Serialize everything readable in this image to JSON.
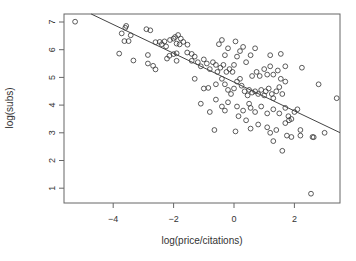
{
  "chart_data": {
    "type": "scatter",
    "title": "",
    "xlabel": "log(price/citations)",
    "ylabel": "log(subs)",
    "xlim": [
      -5.4,
      3.5
    ],
    "ylim": [
      0.5,
      7.3
    ],
    "xticks": [
      -4,
      -2,
      0,
      2
    ],
    "xtick_labels": [
      "-4",
      "-2",
      "0",
      "2"
    ],
    "yticks": [
      1,
      2,
      3,
      4,
      5,
      6,
      7
    ],
    "ytick_labels": [
      "1",
      "2",
      "3",
      "4",
      "5",
      "6",
      "7"
    ],
    "grid": false,
    "legend": null,
    "marker": "open-circle",
    "colors": {
      "points": "#333333",
      "line": "#444444",
      "axis": "#555555",
      "text": "#333333"
    },
    "fit_line": {
      "type": "linear",
      "intercept": 4.83,
      "slope": -0.52
    },
    "points": [
      [
        -5.26,
        7.01
      ],
      [
        -3.72,
        6.59
      ],
      [
        -3.6,
        6.79
      ],
      [
        -3.57,
        6.86
      ],
      [
        -3.63,
        6.31
      ],
      [
        -3.49,
        6.31
      ],
      [
        -3.42,
        6.52
      ],
      [
        -3.8,
        5.86
      ],
      [
        -2.9,
        6.74
      ],
      [
        -2.77,
        6.7
      ],
      [
        -2.6,
        6.27
      ],
      [
        -2.46,
        6.28
      ],
      [
        -2.39,
        6.2
      ],
      [
        -2.3,
        6.3
      ],
      [
        -2.25,
        6.12
      ],
      [
        -2.12,
        6.35
      ],
      [
        -2.0,
        6.4
      ],
      [
        -3.33,
        5.61
      ],
      [
        -2.85,
        5.5
      ],
      [
        -2.68,
        5.42
      ],
      [
        -2.6,
        5.29
      ],
      [
        -2.85,
        5.81
      ],
      [
        -2.22,
        5.68
      ],
      [
        -2.14,
        5.78
      ],
      [
        -2.0,
        5.84
      ],
      [
        -1.9,
        5.87
      ],
      [
        -1.95,
        6.46
      ],
      [
        -1.85,
        6.53
      ],
      [
        -1.76,
        6.4
      ],
      [
        -1.68,
        6.28
      ],
      [
        -1.9,
        6.22
      ],
      [
        -1.8,
        6.19
      ],
      [
        -1.54,
        6.18
      ],
      [
        -1.9,
        5.6
      ],
      [
        -1.55,
        5.9
      ],
      [
        -1.4,
        5.85
      ],
      [
        -1.3,
        5.75
      ],
      [
        -1.4,
        5.6
      ],
      [
        -1.2,
        5.55
      ],
      [
        -1.0,
        5.65
      ],
      [
        -0.9,
        5.5
      ],
      [
        -1.1,
        5.4
      ],
      [
        -0.8,
        5.3
      ],
      [
        -0.7,
        5.55
      ],
      [
        -0.6,
        5.45
      ],
      [
        -0.55,
        5.2
      ],
      [
        -0.45,
        5.35
      ],
      [
        -0.35,
        5.45
      ],
      [
        -0.25,
        5.2
      ],
      [
        -0.15,
        5.3
      ],
      [
        -0.05,
        5.2
      ],
      [
        0.0,
        5.45
      ],
      [
        -0.5,
        6.2
      ],
      [
        -0.4,
        6.35
      ],
      [
        -0.2,
        6.05
      ],
      [
        0.05,
        6.3
      ],
      [
        -0.3,
        5.8
      ],
      [
        0.1,
        5.75
      ],
      [
        0.3,
        6.1
      ],
      [
        0.55,
        5.8
      ],
      [
        0.4,
        5.55
      ],
      [
        -1.3,
        4.95
      ],
      [
        -1.0,
        4.6
      ],
      [
        -0.85,
        4.62
      ],
      [
        -0.6,
        4.75
      ],
      [
        -0.4,
        4.95
      ],
      [
        -0.3,
        4.75
      ],
      [
        -0.2,
        4.55
      ],
      [
        -0.1,
        4.4
      ],
      [
        0.0,
        4.6
      ],
      [
        0.1,
        4.85
      ],
      [
        0.2,
        4.95
      ],
      [
        0.25,
        4.7
      ],
      [
        0.35,
        4.5
      ],
      [
        0.45,
        4.35
      ],
      [
        0.5,
        4.55
      ],
      [
        0.6,
        4.45
      ],
      [
        0.7,
        4.5
      ],
      [
        0.8,
        4.4
      ],
      [
        0.9,
        4.55
      ],
      [
        1.0,
        4.35
      ],
      [
        1.05,
        4.5
      ],
      [
        1.15,
        4.6
      ],
      [
        1.25,
        4.4
      ],
      [
        1.3,
        4.25
      ],
      [
        1.4,
        4.5
      ],
      [
        1.5,
        4.65
      ],
      [
        1.6,
        4.4
      ],
      [
        0.6,
        5.05
      ],
      [
        0.75,
        5.2
      ],
      [
        0.85,
        5.05
      ],
      [
        1.0,
        5.3
      ],
      [
        1.1,
        5.1
      ],
      [
        1.2,
        5.4
      ],
      [
        1.3,
        5.1
      ],
      [
        1.45,
        5.25
      ],
      [
        1.55,
        4.95
      ],
      [
        1.7,
        4.85
      ],
      [
        0.2,
        5.95
      ],
      [
        0.7,
        6.05
      ],
      [
        1.2,
        5.8
      ],
      [
        1.55,
        5.85
      ],
      [
        1.7,
        5.4
      ],
      [
        2.25,
        5.35
      ],
      [
        2.8,
        4.75
      ],
      [
        3.4,
        4.25
      ],
      [
        -0.3,
        3.8
      ],
      [
        0.1,
        3.95
      ],
      [
        0.3,
        3.8
      ],
      [
        0.5,
        4.05
      ],
      [
        0.7,
        3.75
      ],
      [
        0.9,
        3.95
      ],
      [
        1.1,
        3.7
      ],
      [
        1.3,
        3.85
      ],
      [
        1.5,
        3.7
      ],
      [
        1.7,
        3.9
      ],
      [
        1.8,
        3.6
      ],
      [
        1.9,
        3.5
      ],
      [
        2.0,
        3.75
      ],
      [
        2.1,
        3.85
      ],
      [
        1.7,
        3.35
      ],
      [
        1.82,
        3.45
      ],
      [
        -1.1,
        4.05
      ],
      [
        -0.8,
        3.75
      ],
      [
        -0.6,
        4.2
      ],
      [
        -0.4,
        3.95
      ],
      [
        -0.2,
        4.1
      ],
      [
        0.15,
        3.6
      ],
      [
        0.4,
        3.45
      ],
      [
        0.55,
        3.9
      ],
      [
        1.3,
        2.7
      ],
      [
        1.75,
        2.9
      ],
      [
        1.9,
        2.85
      ],
      [
        2.2,
        2.9
      ],
      [
        2.6,
        2.85
      ],
      [
        2.64,
        2.84
      ],
      [
        3.0,
        3.0
      ],
      [
        1.6,
        2.35
      ],
      [
        2.2,
        3.1
      ],
      [
        -0.65,
        3.1
      ],
      [
        0.05,
        3.05
      ],
      [
        0.55,
        3.15
      ],
      [
        0.8,
        3.3
      ],
      [
        1.1,
        3.2
      ],
      [
        1.2,
        3.0
      ],
      [
        1.4,
        3.1
      ],
      [
        2.55,
        0.8
      ]
    ]
  },
  "plot": {
    "xlabel": "log(price/citations)",
    "ylabel": "log(subs)",
    "xtick_labels": [
      "-4",
      "-2",
      "0",
      "2"
    ],
    "ytick_labels": [
      "1",
      "2",
      "3",
      "4",
      "5",
      "6",
      "7"
    ]
  }
}
